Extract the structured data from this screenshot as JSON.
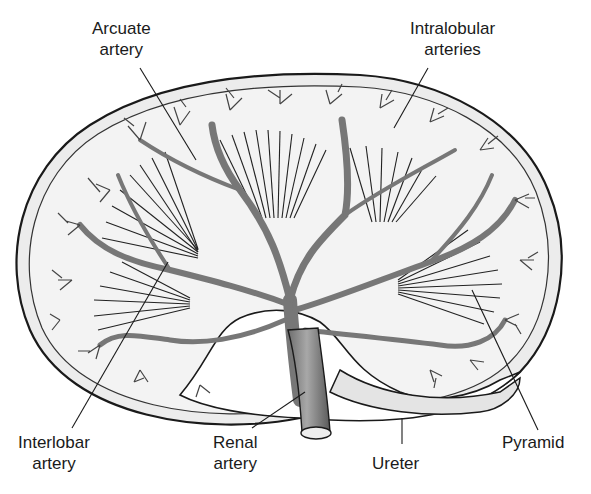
{
  "diagram": {
    "colors": {
      "background": "#ffffff",
      "capsule_fill": "#e9e9e9",
      "cortex_fill": "#f1f1f1",
      "vessel": "#7a7a7a",
      "outline": "#1a1a1a",
      "pelvis_fill": "#f6f6f6"
    },
    "labels": [
      {
        "id": "arcuate-artery",
        "lines": [
          "Arcuate",
          "artery"
        ]
      },
      {
        "id": "intralobular-arteries",
        "lines": [
          "Intralobular",
          "arteries"
        ]
      },
      {
        "id": "interlobar-artery",
        "lines": [
          "Interlobar",
          "artery"
        ]
      },
      {
        "id": "renal-artery",
        "lines": [
          "Renal",
          "artery"
        ]
      },
      {
        "id": "ureter",
        "lines": [
          "Ureter"
        ]
      },
      {
        "id": "pyramid",
        "lines": [
          "Pyramid"
        ]
      }
    ]
  }
}
